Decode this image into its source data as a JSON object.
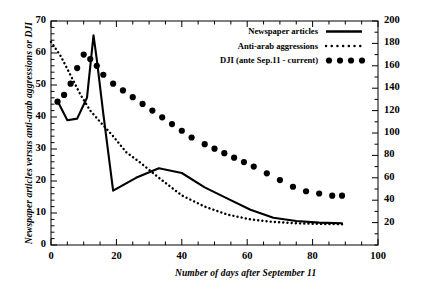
{
  "chart_data": {
    "type": "line",
    "title": "",
    "xlabel": "Number of days after September 11",
    "ylabel": "Newspaper articles versus anti-arab aggressions or DJI",
    "ylabel_right": "",
    "xlim": [
      0,
      100
    ],
    "ylim": [
      0,
      70
    ],
    "ylim_right": [
      0,
      200
    ],
    "grid": false,
    "legend_position": "top-right",
    "x_ticks": [
      0,
      20,
      40,
      60,
      80,
      100
    ],
    "y_ticks_left": [
      0,
      10,
      20,
      30,
      40,
      50,
      60,
      70
    ],
    "y_ticks_right": [
      20,
      40,
      60,
      80,
      100,
      120,
      140,
      160,
      180,
      200
    ],
    "x_minor_interval": 5,
    "y_left_minor_interval": 2,
    "y_right_minor_interval": 10,
    "series": [
      {
        "name": "Newspaper articles",
        "style": "solid-line",
        "axis": "left",
        "x": [
          2,
          5,
          8,
          11,
          13,
          14,
          16,
          19,
          26,
          33,
          40,
          47,
          54,
          61,
          68,
          75,
          82,
          89
        ],
        "values": [
          45,
          39,
          39.5,
          46,
          65.5,
          58,
          41,
          17,
          21,
          24,
          22.5,
          18,
          14.5,
          11,
          8.5,
          7.5,
          7,
          6.8
        ]
      },
      {
        "name": "Anti-arab aggressions",
        "style": "dotted-line",
        "axis": "left",
        "x": [
          0,
          3,
          6,
          9,
          12,
          15,
          19,
          23,
          27,
          33,
          40,
          47,
          54,
          61,
          68,
          75,
          82,
          89
        ],
        "values": [
          63.5,
          59,
          53,
          47,
          42,
          38.5,
          34,
          29,
          26,
          21,
          15.5,
          12,
          9.5,
          8,
          7.2,
          6.8,
          6.6,
          6.5
        ]
      },
      {
        "name": "DJI (ante Sep.11 - current)",
        "style": "big-dots",
        "axis": "right",
        "x": [
          2,
          4,
          6,
          8,
          10,
          12,
          14,
          16,
          19,
          22,
          25,
          28,
          31,
          34,
          37,
          40,
          43,
          47,
          50,
          53,
          56,
          59,
          62,
          66,
          70,
          74,
          78,
          82,
          86,
          89
        ],
        "values": [
          128,
          134,
          144,
          158,
          170,
          166,
          160,
          152,
          144,
          138,
          132,
          126,
          120,
          114,
          108,
          102,
          96,
          90,
          86,
          82,
          78,
          74,
          70,
          64,
          58,
          52,
          48,
          46,
          44,
          44
        ]
      }
    ],
    "legend": [
      {
        "label": "Newspaper articles",
        "marker": "solid-line"
      },
      {
        "label": "Anti-arab aggressions",
        "marker": "dotted-line"
      },
      {
        "label": "DJI (ante Sep.11 - current)",
        "marker": "big-dots"
      }
    ],
    "colors": {
      "line": "#000000",
      "axis": "#000000",
      "background": "#ffffff"
    }
  }
}
